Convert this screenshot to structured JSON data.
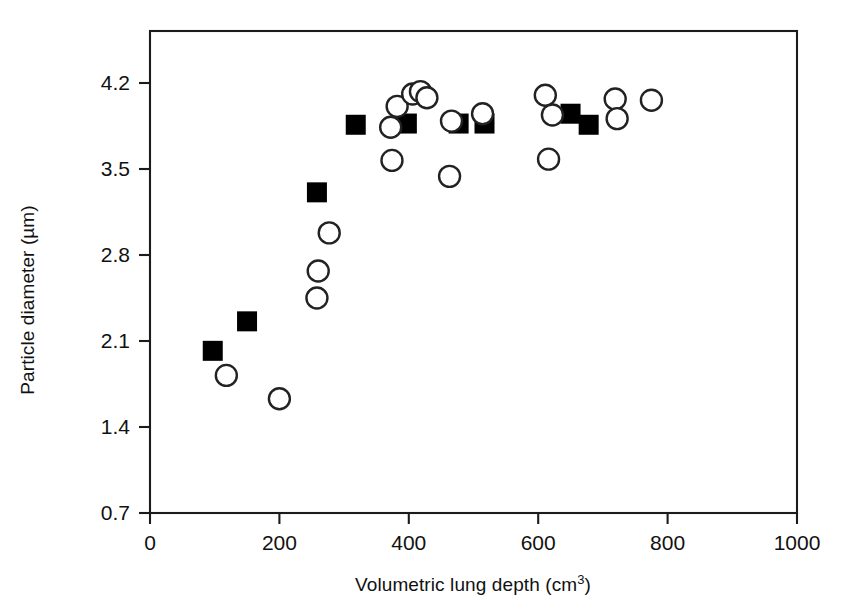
{
  "figure": {
    "background_color": "#ffffff",
    "foreground_color": "#000000",
    "marker_fill_open": "#ffffff",
    "marker_fill_filled": "#000000"
  },
  "chart_data": {
    "type": "scatter",
    "title": "",
    "subtitle": "",
    "xlabel": "Volumetric lung depth (cm³)",
    "xlabel_base": "Volumetric lung depth (cm",
    "xlabel_sup": "3",
    "xlabel_tail": ")",
    "ylabel": "Particle diameter (µm)",
    "xlim": [
      0,
      1000
    ],
    "ylim": [
      0.7,
      4.2
    ],
    "xticks": [
      0,
      200,
      400,
      600,
      800,
      1000
    ],
    "xtick_labels": [
      "0",
      "200",
      "400",
      "600",
      "800",
      "1000"
    ],
    "yticks": [
      0.7,
      1.4,
      2.1,
      2.8,
      3.5,
      4.2
    ],
    "ytick_labels": [
      "0.7",
      "1.4",
      "2.1",
      "2.8",
      "3.5",
      "4.2"
    ],
    "grid": false,
    "legend": null,
    "legend_position": "none",
    "frame": "full-box",
    "series": [
      {
        "name": "filled-squares",
        "marker": "square",
        "marker_style": "filled",
        "color": "#000000",
        "points": [
          {
            "x": 97,
            "y": 2.02
          },
          {
            "x": 150,
            "y": 2.26
          },
          {
            "x": 258,
            "y": 3.31
          },
          {
            "x": 318,
            "y": 3.86
          },
          {
            "x": 397,
            "y": 3.87
          },
          {
            "x": 477,
            "y": 3.87
          },
          {
            "x": 517,
            "y": 3.87
          },
          {
            "x": 650,
            "y": 3.95
          },
          {
            "x": 678,
            "y": 3.86
          }
        ]
      },
      {
        "name": "open-circles",
        "marker": "circle",
        "marker_style": "open",
        "color": "#222222",
        "points": [
          {
            "x": 118,
            "y": 1.82
          },
          {
            "x": 200,
            "y": 1.63
          },
          {
            "x": 258,
            "y": 2.45
          },
          {
            "x": 260,
            "y": 2.67
          },
          {
            "x": 277,
            "y": 2.98
          },
          {
            "x": 372,
            "y": 3.84
          },
          {
            "x": 374,
            "y": 3.57
          },
          {
            "x": 382,
            "y": 4.01
          },
          {
            "x": 406,
            "y": 4.11
          },
          {
            "x": 418,
            "y": 4.13
          },
          {
            "x": 428,
            "y": 4.08
          },
          {
            "x": 463,
            "y": 3.44
          },
          {
            "x": 466,
            "y": 3.89
          },
          {
            "x": 514,
            "y": 3.95
          },
          {
            "x": 611,
            "y": 4.1
          },
          {
            "x": 616,
            "y": 3.58
          },
          {
            "x": 622,
            "y": 3.94
          },
          {
            "x": 719,
            "y": 4.07
          },
          {
            "x": 722,
            "y": 3.91
          },
          {
            "x": 775,
            "y": 4.06
          }
        ]
      }
    ]
  }
}
